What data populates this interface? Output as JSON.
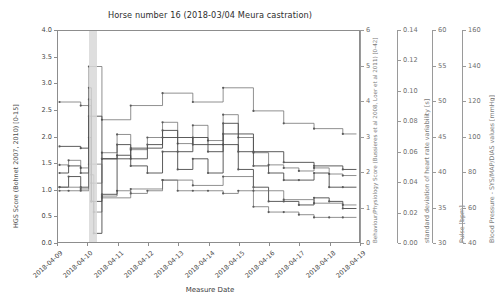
{
  "figure": {
    "title": "Horse number 16 (2018-03/04 Meura castration)",
    "background": "#ffffff",
    "line_color": "#6b6b6b"
  },
  "chart_data": {
    "type": "line",
    "title": "Horse number 16 (2018-03/04 Meura castration)",
    "xlabel": "Measure Date",
    "grid": false,
    "legend": "none",
    "drawstyle": "steps-post",
    "x_ticklabels": [
      "2018-04-09",
      "2018-04-10",
      "2018-04-11",
      "2018-04-12",
      "2018-04-13",
      "2018-04-14",
      "2018-04-15",
      "2018-04-16",
      "2018-04-17",
      "2018-04-18",
      "2018-04-19"
    ],
    "xlim": [
      "2018-04-09",
      "2018-04-19"
    ],
    "annotations": [
      {
        "name": "surgery-span",
        "type": "vspan",
        "color": "#d8d8d8",
        "x_start": "2018-04-10T04:00",
        "x_end": "2018-04-10T10:00"
      }
    ],
    "axes": [
      {
        "id": "hgs",
        "position": "left",
        "ylabel": "HGS Score (Bohnet 2007, 2010) [0-15]",
        "ylim": [
          0.0,
          4.0
        ],
        "yticks": [
          "0.0",
          "0.5",
          "1.0",
          "1.5",
          "2.0",
          "2.5",
          "3.0",
          "3.5",
          "4.0"
        ],
        "series": [
          {
            "name": "HGS Score",
            "x": [
              0.05,
              0.35,
              0.75,
              1.02,
              1.1,
              1.18,
              1.45,
              1.95,
              2.4,
              2.95,
              3.45,
              3.95,
              4.45,
              4.95,
              5.45,
              5.95,
              6.45,
              6.95,
              7.45,
              7.95,
              8.45,
              8.95,
              9.4
            ],
            "y": [
              1.0,
              1.0,
              1.0,
              2.6,
              1.3,
              0.6,
              0.9,
              1.0,
              0.95,
              1.0,
              1.2,
              1.0,
              1.0,
              1.0,
              0.95,
              1.0,
              0.7,
              0.6,
              0.6,
              0.55,
              0.5,
              0.5,
              0.5
            ]
          }
        ]
      },
      {
        "id": "behaviour",
        "position": "right-1",
        "ylabel": "Behaviour/Physiology Score (Bussieres et al 2008, Loer et al 2011) [0-42]",
        "ylim": [
          0,
          6
        ],
        "yticks": [
          "0",
          "1",
          "2",
          "3",
          "4",
          "5",
          "6"
        ],
        "series": [
          {
            "name": "Behaviour/Physiology Score",
            "x": [
              0.05,
              0.35,
              0.75,
              1.02,
              1.1,
              1.18,
              1.45,
              1.95,
              2.4,
              2.95,
              3.45,
              3.95,
              4.45,
              4.95,
              5.45,
              5.95,
              6.45,
              6.95,
              7.45,
              7.95,
              8.45,
              8.95,
              9.4
            ],
            "y": [
              1.6,
              1.9,
              1.6,
              3.0,
              1.2,
              0.3,
              1.4,
              2.5,
              2.2,
              2.0,
              2.6,
              2.1,
              2.4,
              2.0,
              2.8,
              2.1,
              1.6,
              1.2,
              1.2,
              1.1,
              1.3,
              1.2,
              1.0
            ]
          }
        ]
      },
      {
        "id": "hrv",
        "position": "right-2",
        "ylabel": "standard deviation of heart rate variability [s]",
        "ylim": [
          0.0,
          0.14
        ],
        "yticks": [
          "0.00",
          "0.02",
          "0.04",
          "0.06",
          "0.08",
          "0.10",
          "0.12",
          "0.14"
        ],
        "series": [
          {
            "name": "SD of HRV",
            "x": [
              0.05,
              0.35,
              0.75,
              1.02,
              1.1,
              1.45,
              1.95,
              2.4,
              2.95,
              3.45,
              3.95,
              4.45,
              4.95,
              5.45,
              5.95,
              6.45,
              6.95,
              7.45,
              7.95,
              8.45,
              8.95,
              9.4
            ],
            "y": [
              0.052,
              0.055,
              0.05,
              0.095,
              0.04,
              0.06,
              0.072,
              0.062,
              0.07,
              0.08,
              0.066,
              0.078,
              0.068,
              0.085,
              0.07,
              0.06,
              0.052,
              0.05,
              0.048,
              0.05,
              0.046,
              0.045
            ]
          }
        ]
      },
      {
        "id": "pulse",
        "position": "right-3",
        "ylabel": "Pulse [bpm]",
        "ylim": [
          30,
          60
        ],
        "yticks": [
          "30",
          "35",
          "40",
          "45",
          "50",
          "55",
          "60"
        ],
        "series": [
          {
            "name": "Pulse",
            "x": [
              0.05,
              0.35,
              0.75,
              1.02,
              1.1,
              1.45,
              1.95,
              2.4,
              2.95,
              3.45,
              3.95,
              4.45,
              4.95,
              5.45,
              5.95,
              6.45,
              6.95,
              7.45,
              7.95,
              8.45,
              8.95,
              9.4
            ],
            "y": [
              40,
              41,
              40,
              52,
              36,
              42,
              44,
              42,
              44,
              46,
              43,
              45,
              43,
              47,
              43,
              41,
              40,
              39,
              39,
              40,
              38,
              38
            ]
          }
        ]
      },
      {
        "id": "bloodpressure",
        "position": "right-4",
        "ylabel": "Blood Pressure - SYS/MAP/DIAS values [mmHg]",
        "ylim": [
          40,
          160
        ],
        "yticks": [
          "40",
          "60",
          "80",
          "100",
          "120",
          "140",
          "160"
        ],
        "series": [
          {
            "name": "SYS",
            "x": [
              0.05,
              0.75,
              1.02,
              1.45,
              2.4,
              3.45,
              4.45,
              5.45,
              6.45,
              7.45,
              8.45,
              9.4
            ],
            "y": [
              120,
              118,
              140,
              110,
              118,
              125,
              120,
              128,
              115,
              108,
              105,
              102
            ]
          },
          {
            "name": "MAP",
            "x": [
              0.05,
              0.75,
              1.02,
              1.45,
              2.4,
              3.45,
              4.45,
              5.45,
              6.45,
              7.45,
              8.45,
              9.4
            ],
            "y": [
              95,
              94,
              112,
              88,
              94,
              100,
              96,
              102,
              92,
              86,
              84,
              82
            ]
          },
          {
            "name": "DIAS",
            "x": [
              0.05,
              0.75,
              1.02,
              1.45,
              2.4,
              3.45,
              4.45,
              5.45,
              6.45,
              7.45,
              8.45,
              9.4
            ],
            "y": [
              72,
              71,
              85,
              66,
              71,
              76,
              73,
              78,
              70,
              65,
              63,
              62
            ]
          }
        ]
      }
    ]
  },
  "xaxis": {
    "title": "Measure Date"
  }
}
